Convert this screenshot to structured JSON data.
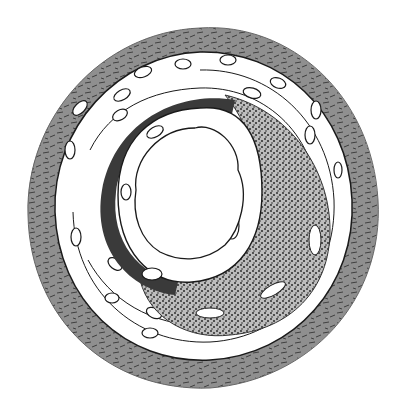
{
  "figure": {
    "colors": {
      "background": "#ffffff",
      "adventitia": "#8f8f8f",
      "media_cells": "#ffffff",
      "outline": "#1a1a1a",
      "elastic_band": "#3a3a3a",
      "plaque": "#6a6a6a",
      "lumen": "#ffffff"
    }
  }
}
